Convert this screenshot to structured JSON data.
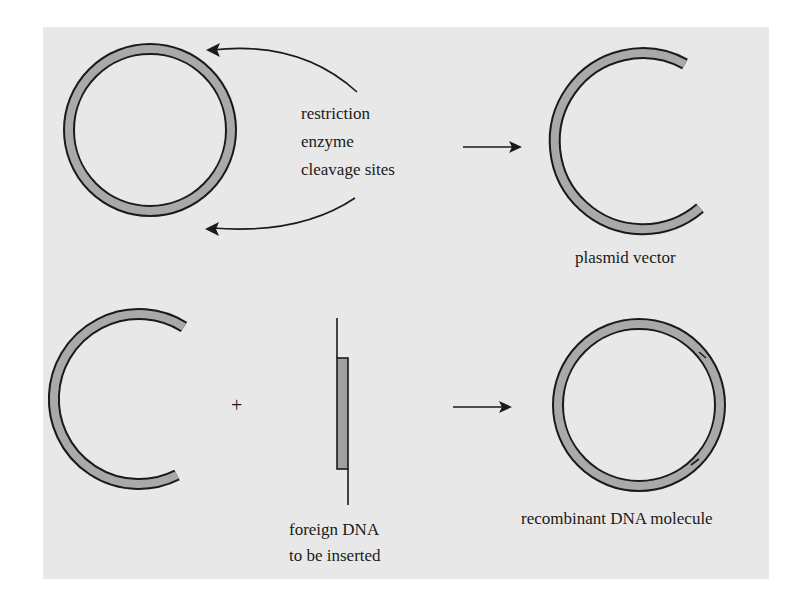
{
  "figure": {
    "background_color": "#e8e8e8",
    "strand_fill_color": "#a9a9a9",
    "stroke_color": "#1a1a1a"
  },
  "step1": {
    "intact_plasmid": "circular plasmid",
    "annotation": {
      "line1": "restriction",
      "line2": "enzyme",
      "line3": "cleavage sites"
    },
    "result_label": "plasmid vector"
  },
  "step2": {
    "plus_symbol": "+",
    "insert_label": {
      "line1": "foreign DNA",
      "line2": "to be inserted"
    },
    "result_label": "recombinant DNA molecule"
  }
}
